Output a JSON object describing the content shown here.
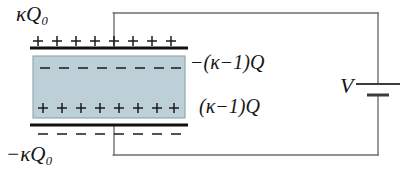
{
  "figure": {
    "name": "parallel-plate-capacitor-with-dielectric",
    "background_color": "#ffffff",
    "wire_color": "#6e6e6e",
    "plate_color": "#111111",
    "dielectric_fill": "#bdd0d8",
    "dielectric_border": "#8fa3ac",
    "charge_color": "#1a1a1a"
  },
  "labels": {
    "top_plate_charge": {
      "kappa": "κ",
      "symbol": "Q",
      "subscript": "0",
      "sign": "",
      "full_text": "κQ₀"
    },
    "bottom_plate_charge": {
      "kappa": "κ",
      "symbol": "Q",
      "subscript": "0",
      "sign": "−",
      "full_text": "−κQ₀"
    },
    "dielectric_top_bound_charge": {
      "full_text": "−(κ−1)Q",
      "sign": "−",
      "body": "(κ−1)Q"
    },
    "dielectric_bottom_bound_charge": {
      "full_text": "(κ−1)Q",
      "sign": "",
      "body": "(κ−1)Q"
    },
    "battery_voltage": {
      "full_text": "V"
    }
  },
  "charges": {
    "top_plate_surface": {
      "glyph": "+",
      "count": 8,
      "row_label": "plus-row-above-top-plate"
    },
    "dielectric_top_face": {
      "glyph": "−",
      "count": 8,
      "row_label": "minus-row-dielectric-top"
    },
    "dielectric_bottom_face": {
      "glyph": "+",
      "count": 8,
      "row_label": "plus-row-dielectric-bottom"
    },
    "bottom_plate_surface": {
      "glyph": "−",
      "count": 8,
      "row_label": "minus-row-below-bottom-plate"
    }
  },
  "geometry": {
    "circuit": {
      "left_x": 114,
      "right_x": 378,
      "top_y": 13,
      "bottom_y": 155,
      "stroke_width": 1.4
    },
    "top_plate": {
      "x1": 30,
      "x2": 188,
      "y": 48,
      "thickness": 3
    },
    "bottom_plate": {
      "x1": 30,
      "x2": 188,
      "y": 125,
      "thickness": 3
    },
    "dielectric": {
      "x": 33,
      "y": 56,
      "width": 152,
      "height": 62
    },
    "battery": {
      "x": 378,
      "long_plate_y": 84,
      "long_plate_half_width": 22,
      "short_plate_y": 95,
      "short_plate_half_width": 11
    },
    "charge_rows": {
      "top_plate_y": 41,
      "dielectric_top_y": 68,
      "dielectric_bottom_y": 108,
      "bottom_plate_y": 134,
      "start_x": 38,
      "spacing": 19
    }
  }
}
